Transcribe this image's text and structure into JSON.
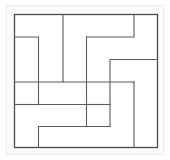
{
  "figure": {
    "symmetry": "4-fold rotational (C4)",
    "region_count": 9,
    "background_color": "#ffffff",
    "plate_fill": "#ffffff",
    "stroke_color": "#5a5a5a",
    "border_color": "#4a4a4a",
    "halo_color": "#ebebeb",
    "halo_fill": "#fbfbfb",
    "stroke_width": 1.1,
    "border_width": 1.3,
    "viewbox": "0 0 170 160",
    "border": {
      "x": 14.5,
      "y": 14.5,
      "width": 143,
      "height": 133
    },
    "grid": {
      "x": [
        14.5,
        38.5,
        63.0,
        86.5,
        110.0,
        134.0,
        157.5
      ],
      "y": [
        14.5,
        37.0,
        59.5,
        82.0,
        104.5,
        126.5,
        147.5
      ]
    },
    "paths": [
      {
        "name": "top-left-zigzag",
        "d": "M 14.5 37.0 L 38.5 37.0 L 38.5 104.5 L 86.5 104.5"
      },
      {
        "name": "top-center-drop",
        "d": "M 63.0 14.5 L 63.0 82.0 L 14.5 82.0"
      },
      {
        "name": "upper-right-zigzag",
        "d": "M 86.5 37.0 L 134.0 37.0 L 134.0 14.5"
      },
      {
        "name": "center-vertical-upper",
        "d": "M 86.5 37.0 L 86.5 104.5"
      },
      {
        "name": "right-upper-step",
        "d": "M 157.5 59.5 L 110.0 59.5 L 110.0 126.5"
      },
      {
        "name": "center-horizontal",
        "d": "M 63.0 82.0 L 134.0 82.0"
      },
      {
        "name": "right-lower-step",
        "d": "M 134.0 82.0 L 134.0 147.5"
      },
      {
        "name": "bottom-left-step",
        "d": "M 14.5 104.5 L 38.5 104.5"
      },
      {
        "name": "bottom-center-zigzag",
        "d": "M 38.5 147.5 L 38.5 126.5 L 86.5 126.5 L 86.5 82.0"
      },
      {
        "name": "lower-center-rise",
        "d": "M 110.0 126.5 L 63.0 126.5"
      },
      {
        "name": "bottom-right-drop",
        "d": "M 86.5 104.5 L 110.0 104.5"
      }
    ]
  }
}
